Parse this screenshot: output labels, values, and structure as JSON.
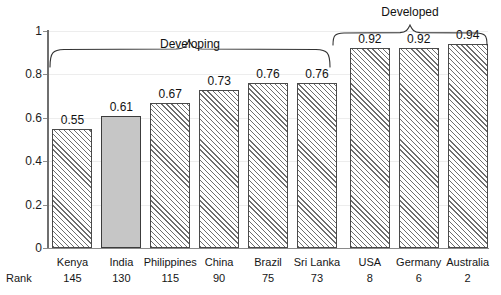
{
  "chart_data": {
    "type": "bar",
    "title": "",
    "xlabel": "",
    "ylabel": "",
    "ylim": [
      0,
      1
    ],
    "yticks": [
      "0",
      "0.2",
      "0.4",
      "0.6",
      "0.8",
      "1"
    ],
    "grid": true,
    "legend_position": "none",
    "categories": [
      "Kenya",
      "India",
      "Philippines",
      "China",
      "Brazil",
      "Sri Lanka",
      "USA",
      "Germany",
      "Australia"
    ],
    "values": [
      0.55,
      0.61,
      0.67,
      0.73,
      0.76,
      0.76,
      0.92,
      0.92,
      0.94
    ],
    "value_labels": [
      "0.55",
      "0.61",
      "0.67",
      "0.73",
      "0.76",
      "0.76",
      "0.92",
      "0.92",
      "0.94"
    ],
    "secondary_axis_label": "Rank",
    "ranks": [
      "145",
      "130",
      "115",
      "90",
      "75",
      "73",
      "8",
      "6",
      "2"
    ],
    "highlighted_category": "India",
    "bar_styles": [
      "hatched",
      "solid",
      "hatched",
      "hatched",
      "hatched",
      "hatched",
      "hatched",
      "hatched",
      "hatched"
    ],
    "annotations": [
      {
        "label": "Developing",
        "covers": [
          "Kenya",
          "India",
          "Philippines",
          "China",
          "Brazil",
          "Sri Lanka"
        ]
      },
      {
        "label": "Developed",
        "covers": [
          "USA",
          "Germany",
          "Australia"
        ]
      }
    ],
    "colors": {
      "hatch_stroke": "#6e6e6e",
      "solid_fill": "#c6c6c6",
      "bar_outline": "#4a4a4a",
      "axis": "#6f6f6f",
      "gridline": "#ededed",
      "text": "#111111"
    }
  }
}
